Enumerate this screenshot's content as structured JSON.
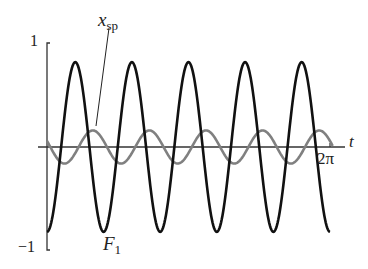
{
  "chart_data": {
    "type": "line",
    "title": "",
    "xlabel": "t",
    "ylabel": "",
    "xlim": [
      0,
      6.2832
    ],
    "ylim": [
      -1,
      1
    ],
    "x_tick_labels": [
      "2π"
    ],
    "y_tick_labels": [
      "1",
      "−1"
    ],
    "grid": false,
    "series": [
      {
        "name": "F1",
        "label_main": "F",
        "label_sub": "1",
        "color": "#111111",
        "function": "-0.82*cos(5t)",
        "amplitude": 0.82,
        "cycles": 5,
        "phase": "starts at minimum"
      },
      {
        "name": "x_sp",
        "label_main": "x",
        "label_sub": "sp",
        "color": "#808080",
        "function": "0.16*cos(5t + 1.2)",
        "amplitude": 0.16,
        "cycles": 5,
        "phase": "starts slightly above zero, decreasing"
      }
    ],
    "annotations": [
      {
        "text": "x_sp",
        "points_to": "gray curve first peak"
      },
      {
        "text": "F1",
        "points_to": "black curve second trough"
      }
    ]
  },
  "labels": {
    "y_top": "1",
    "y_bottom": "−1",
    "x_axis": "t",
    "x_end": "2π",
    "xsp_main": "x",
    "xsp_sub": "sp",
    "f1_main": "F",
    "f1_sub": "1"
  }
}
